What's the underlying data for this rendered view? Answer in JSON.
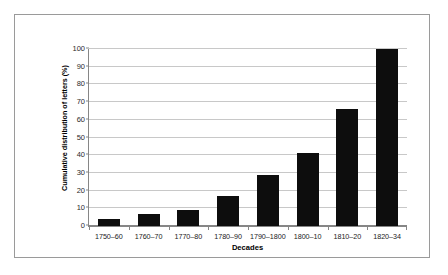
{
  "chart_data": {
    "type": "bar",
    "title": "",
    "xlabel": "Decades",
    "ylabel": "Cumulative distribution of letters (%)",
    "categories": [
      "1750–60",
      "1760–70",
      "1770–80",
      "1780–90",
      "1790–1800",
      "1800–10",
      "1810–20",
      "1820–34"
    ],
    "values": [
      4,
      7,
      9,
      17,
      29,
      41,
      66,
      100
    ],
    "ylim": [
      0,
      100
    ],
    "yticks": [
      0,
      10,
      20,
      30,
      40,
      50,
      60,
      70,
      80,
      90,
      100
    ],
    "ytick_labels": [
      "0",
      "10",
      "20",
      "30",
      "40",
      "50",
      "60",
      "70",
      "80",
      "90",
      "100"
    ],
    "grid": true,
    "grid_axis": "y",
    "legend": false,
    "bar_color": "#0d0d0d",
    "gridline_color": "#c8c8c8",
    "axis_color": "#868686",
    "background_color": "#ffffff",
    "frame_color": "#9a9a9a"
  }
}
